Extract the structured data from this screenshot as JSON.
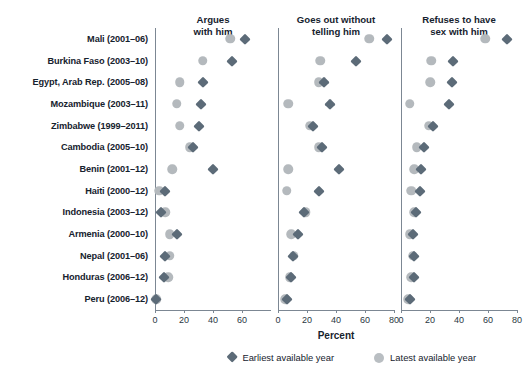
{
  "chart_data": {
    "type": "scatter",
    "title": "",
    "xlabel": "Percent",
    "ylabel": "",
    "xlim": [
      0,
      80
    ],
    "grid": false,
    "legend_position": "bottom",
    "legend": [
      {
        "name": "Earliest available year",
        "marker": "diamond",
        "color": "#5c6b78"
      },
      {
        "name": "Latest available year",
        "marker": "circle",
        "color": "#b4b9bd"
      }
    ],
    "categories": [
      "Mali (2001–06)",
      "Burkina Faso (2003–10)",
      "Egypt, Arab Rep. (2005–08)",
      "Mozambique (2003–11)",
      "Zimbabwe (1999–2011)",
      "Cambodia (2005–10)",
      "Benin (2001–12)",
      "Haiti (2000–12)",
      "Indonesia (2003–12)",
      "Armenia (2000–10)",
      "Nepal (2001–06)",
      "Honduras (2006–12)",
      "Peru (2006–12)"
    ],
    "panels": [
      {
        "title_lines": [
          "Argues",
          "with him"
        ],
        "ticks": [
          0,
          20,
          40,
          60
        ],
        "tick_labels": [
          "0",
          "20",
          "40",
          "60"
        ],
        "series": [
          {
            "name": "Earliest available year",
            "marker": "diamond",
            "values": [
              62,
              53,
              33,
              32,
              30,
              26,
              40,
              7,
              4,
              15,
              7,
              6,
              1
            ]
          },
          {
            "name": "Latest available year",
            "marker": "circle",
            "values": [
              52,
              33,
              17,
              15,
              17,
              24,
              12,
              3,
              7,
              10,
              10,
              9,
              1
            ]
          }
        ]
      },
      {
        "title_lines": [
          "Goes out without",
          "telling him"
        ],
        "ticks": [
          0,
          20,
          40,
          60,
          80
        ],
        "tick_labels": [
          "0",
          "20",
          "40",
          "60",
          "80"
        ],
        "series": [
          {
            "name": "Earliest available year",
            "marker": "diamond",
            "values": [
              75,
              54,
              32,
              36,
              24,
              30,
              42,
              28,
              18,
              14,
              10,
              9,
              6
            ]
          },
          {
            "name": "Latest available year",
            "marker": "circle",
            "values": [
              63,
              29,
              28,
              7,
              22,
              28,
              7,
              6,
              19,
              9,
              11,
              8,
              5
            ]
          }
        ]
      },
      {
        "title_lines": [
          "Refuses to have",
          "sex with him"
        ],
        "ticks": [
          0,
          20,
          40,
          60,
          80
        ],
        "tick_labels": [
          "0",
          "20",
          "40",
          "60",
          "80"
        ],
        "series": [
          {
            "name": "Earliest available year",
            "marker": "diamond",
            "values": [
              73,
              36,
              35,
              33,
              22,
              16,
              14,
              13,
              10,
              8,
              9,
              9,
              6
            ]
          },
          {
            "name": "Latest available year",
            "marker": "circle",
            "values": [
              58,
              21,
              20,
              6,
              19,
              11,
              9,
              7,
              9,
              6,
              8,
              7,
              5
            ]
          }
        ]
      }
    ]
  },
  "layout": {
    "plot_top": 28,
    "plot_bottom": 310,
    "row_count": 13,
    "panels_geom": [
      {
        "x": 155,
        "width": 116
      },
      {
        "x": 278,
        "width": 116
      },
      {
        "x": 401,
        "width": 116
      }
    ],
    "label_right": 148,
    "xlabel_x": 336,
    "xlabel_y": 330,
    "legend_left": 228,
    "legend_top": 352
  }
}
